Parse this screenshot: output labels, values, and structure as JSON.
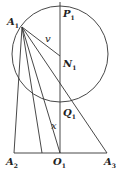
{
  "diagram": {
    "labels": {
      "A1": "A",
      "A1_sub": "1",
      "P1": "P",
      "P1_sub": "1",
      "N1": "N",
      "N1_sub": "1",
      "Q1": "Q",
      "Q1_sub": "1",
      "A2": "A",
      "A2_sub": "2",
      "O1": "O",
      "O1_sub": "1",
      "A3": "A",
      "A3_sub": "3",
      "v": "v",
      "x": "x"
    },
    "stroke_color": "#333333"
  }
}
